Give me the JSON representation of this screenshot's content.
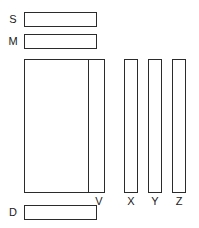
{
  "diagram": {
    "background_color": "#ffffff",
    "stroke_color": "#2b2b2b",
    "fill_color": "#ffffff",
    "row_labels": [
      {
        "id": "S",
        "text": "S"
      },
      {
        "id": "M",
        "text": "M"
      },
      {
        "id": "D",
        "text": "D"
      }
    ],
    "column_labels": [
      {
        "id": "V",
        "text": "V"
      },
      {
        "id": "X",
        "text": "X"
      },
      {
        "id": "Y",
        "text": "Y"
      },
      {
        "id": "Z",
        "text": "Z"
      }
    ],
    "blocks": [
      {
        "id": "S",
        "shape": "horizontal-bar"
      },
      {
        "id": "M",
        "shape": "horizontal-bar"
      },
      {
        "id": "MAIN",
        "shape": "large-rectangle"
      },
      {
        "id": "V",
        "shape": "vertical-bar"
      },
      {
        "id": "X",
        "shape": "vertical-bar"
      },
      {
        "id": "Y",
        "shape": "vertical-bar"
      },
      {
        "id": "Z",
        "shape": "vertical-bar"
      },
      {
        "id": "D",
        "shape": "horizontal-bar"
      }
    ]
  }
}
